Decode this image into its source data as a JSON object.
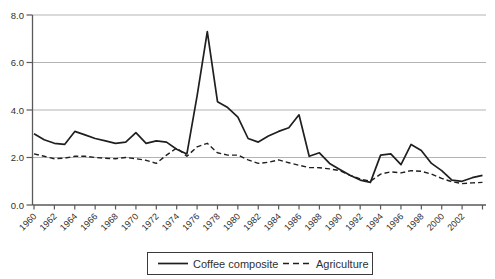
{
  "chart_data": {
    "type": "line",
    "title": "",
    "xlabel": "",
    "ylabel": "",
    "ylim": [
      0,
      8
    ],
    "grid": "horizontal-only",
    "legend_position": "bottom-center-boxed",
    "x": [
      1960,
      1961,
      1962,
      1963,
      1964,
      1965,
      1966,
      1967,
      1968,
      1969,
      1970,
      1971,
      1972,
      1973,
      1974,
      1975,
      1976,
      1977,
      1978,
      1979,
      1980,
      1981,
      1982,
      1983,
      1984,
      1985,
      1986,
      1987,
      1988,
      1989,
      1990,
      1991,
      1992,
      1993,
      1994,
      1995,
      1996,
      1997,
      1998,
      1999,
      2000,
      2001,
      2002,
      2003,
      2004
    ],
    "series": [
      {
        "name": "Coffee composite",
        "line_style": "solid",
        "values": [
          3.0,
          2.75,
          2.6,
          2.55,
          3.1,
          2.95,
          2.8,
          2.7,
          2.6,
          2.65,
          3.05,
          2.6,
          2.7,
          2.65,
          2.35,
          2.15,
          4.6,
          7.3,
          4.35,
          4.1,
          3.7,
          2.8,
          2.65,
          2.9,
          3.1,
          3.25,
          3.8,
          2.05,
          2.2,
          1.75,
          1.5,
          1.25,
          1.05,
          0.95,
          2.1,
          2.15,
          1.7,
          2.55,
          2.3,
          1.75,
          1.45,
          1.05,
          1.0,
          1.15,
          1.25
        ]
      },
      {
        "name": "Agriculture",
        "line_style": "dashed",
        "values": [
          2.15,
          2.05,
          1.95,
          1.97,
          2.05,
          2.05,
          2.0,
          1.97,
          1.95,
          2.0,
          1.95,
          1.88,
          1.75,
          2.1,
          2.4,
          2.05,
          2.45,
          2.6,
          2.2,
          2.1,
          2.1,
          1.9,
          1.75,
          1.8,
          1.9,
          1.78,
          1.67,
          1.58,
          1.57,
          1.52,
          1.45,
          1.25,
          1.1,
          1.0,
          1.3,
          1.4,
          1.35,
          1.45,
          1.42,
          1.3,
          1.12,
          0.98,
          0.9,
          0.93,
          0.95
        ]
      }
    ],
    "y_tick_values": [
      0,
      2,
      4,
      6,
      8
    ],
    "y_tick_labels": [
      "0.0",
      "2.0",
      "4.0",
      "6.0",
      "8.0"
    ],
    "x_tick_years": [
      1960,
      1962,
      1964,
      1966,
      1968,
      1970,
      1972,
      1974,
      1976,
      1978,
      1980,
      1982,
      1984,
      1986,
      1988,
      1990,
      1992,
      1994,
      1996,
      1998,
      2000,
      2002,
      2004
    ],
    "x_tick_labels": [
      "1960",
      "1962",
      "1964",
      "1966",
      "1968",
      "1970",
      "1972",
      "1974",
      "1976",
      "1978",
      "1980",
      "1982",
      "1984",
      "1986",
      "1988",
      "1990",
      "1992",
      "1994",
      "1996",
      "1998",
      "2000",
      "2002"
    ],
    "colors": {
      "series_line": "#1f1f1f",
      "gridline": "#b3b3b3",
      "axis": "#595959",
      "text": "#303030",
      "background": "#ffffff",
      "legend_border": "#3a3a3a"
    }
  }
}
